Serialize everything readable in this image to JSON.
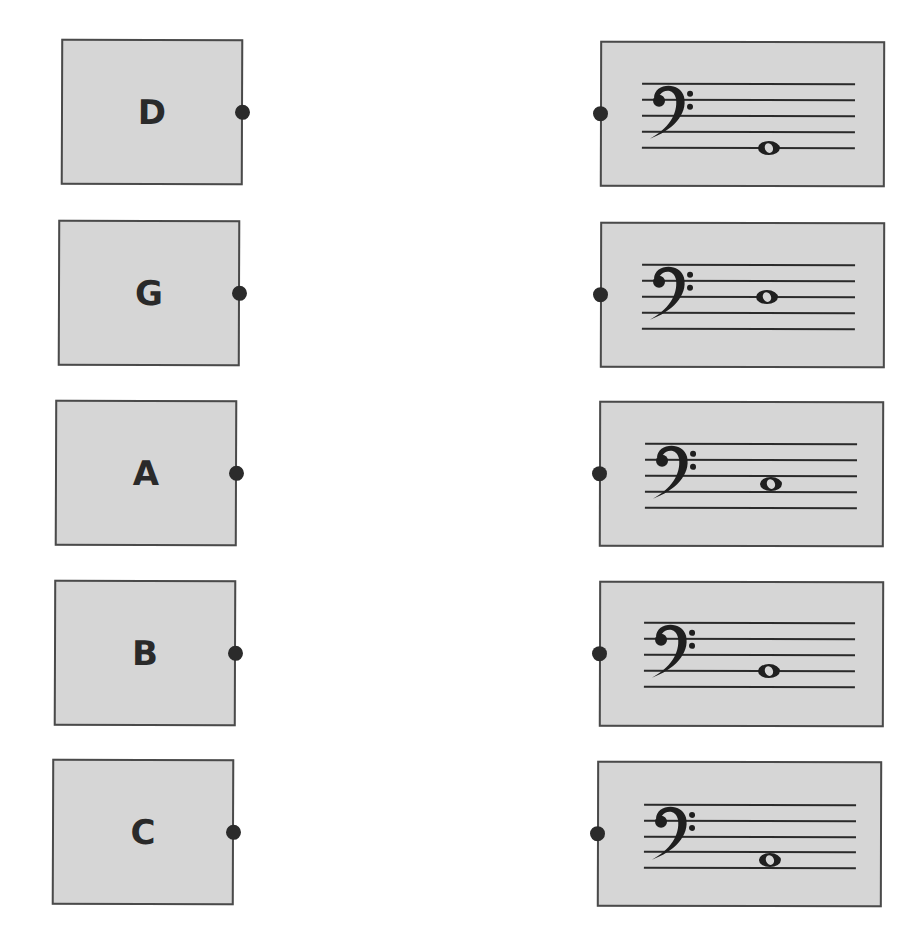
{
  "worksheet": {
    "instructions": "",
    "left_cards": [
      {
        "label": "D"
      },
      {
        "label": "G"
      },
      {
        "label": "A"
      },
      {
        "label": "B"
      },
      {
        "label": "C"
      }
    ],
    "right_cards": [
      {
        "clef": "bass-clef",
        "note_position": "line-1",
        "note_name": "G"
      },
      {
        "clef": "bass-clef",
        "note_position": "line-3",
        "note_name": "D"
      },
      {
        "clef": "bass-clef",
        "note_position": "space-2",
        "note_name": "C"
      },
      {
        "clef": "bass-clef",
        "note_position": "line-2",
        "note_name": "B"
      },
      {
        "clef": "bass-clef",
        "note_position": "space-1",
        "note_name": "A"
      }
    ]
  },
  "colors": {
    "card_fill": "#d6d6d6",
    "card_border": "#4a4a4a",
    "ink": "#2a2a2a"
  }
}
